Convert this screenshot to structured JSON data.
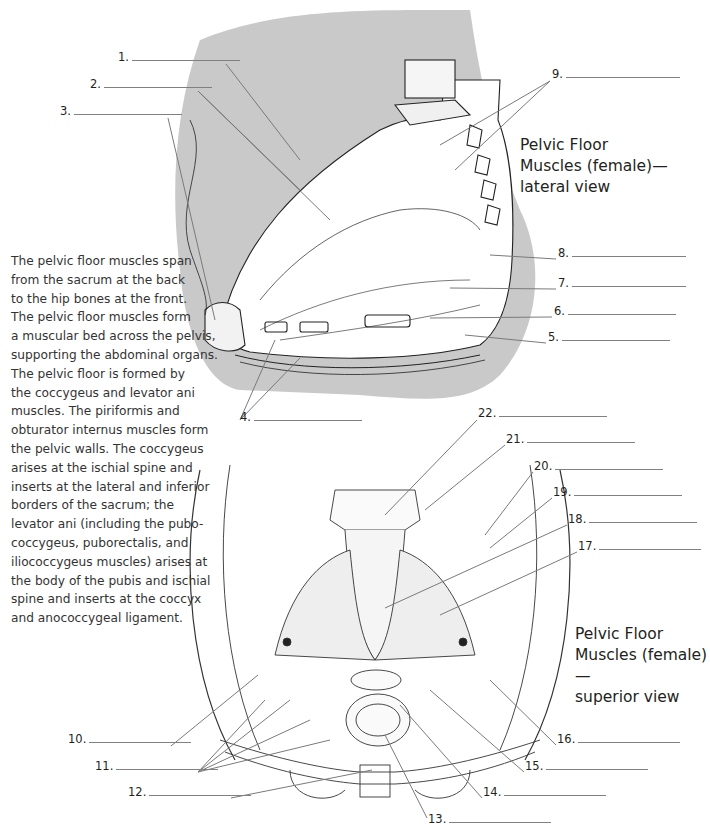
{
  "description": [
    "The pelvic floor muscles span",
    "from the sacrum at the back",
    "to the hip bones at the front.",
    "The pelvic floor muscles form",
    "a muscular bed across the pelvis,",
    "supporting the abdominal organs.",
    "The pelvic floor is formed by",
    "the coccygeus and levator ani",
    "muscles. The piriformis and",
    "obturator internus muscles form",
    "the pelvic walls. The coccygeus",
    "arises at the ischial spine and",
    "inserts at the lateral and inferior",
    "borders of the sacrum; the",
    "levator ani (including the pubo-",
    "coccygeus, puborectalis, and",
    "iliococcygeus muscles) arises at",
    "the body of the pubis and ischial",
    "spine and inserts at the coccyx",
    "and anococcygeal ligament."
  ],
  "lateral_view": {
    "title_lines": [
      "Pelvic Floor",
      "Muscles (female)—",
      "lateral view"
    ],
    "labels": [
      {
        "num": "1.",
        "x": 118,
        "y": 58,
        "w": 108
      },
      {
        "num": "2.",
        "x": 90,
        "y": 85,
        "w": 108
      },
      {
        "num": "3.",
        "x": 60,
        "y": 112,
        "w": 108
      },
      {
        "num": "4.",
        "x": 240,
        "y": 418,
        "w": 108
      },
      {
        "num": "5.",
        "x": 548,
        "y": 338,
        "w": 108
      },
      {
        "num": "6.",
        "x": 554,
        "y": 312,
        "w": 108
      },
      {
        "num": "7.",
        "x": 558,
        "y": 284,
        "w": 114
      },
      {
        "num": "8.",
        "x": 558,
        "y": 254,
        "w": 114
      },
      {
        "num": "9.",
        "x": 552,
        "y": 75,
        "w": 114
      }
    ]
  },
  "superior_view": {
    "title_lines": [
      "Pelvic Floor",
      "Muscles (female)—",
      "superior view"
    ],
    "labels": [
      {
        "num": "10.",
        "x": 68,
        "y": 740,
        "w": 102
      },
      {
        "num": "11.",
        "x": 95,
        "y": 767,
        "w": 102
      },
      {
        "num": "12.",
        "x": 128,
        "y": 793,
        "w": 102
      },
      {
        "num": "13.",
        "x": 428,
        "y": 820,
        "w": 102
      },
      {
        "num": "14.",
        "x": 483,
        "y": 793,
        "w": 102
      },
      {
        "num": "15.",
        "x": 525,
        "y": 767,
        "w": 102
      },
      {
        "num": "16.",
        "x": 557,
        "y": 740,
        "w": 102
      },
      {
        "num": "17.",
        "x": 578,
        "y": 547,
        "w": 102
      },
      {
        "num": "18.",
        "x": 568,
        "y": 520,
        "w": 108
      },
      {
        "num": "19.",
        "x": 553,
        "y": 493,
        "w": 108
      },
      {
        "num": "20.",
        "x": 534,
        "y": 467,
        "w": 108
      },
      {
        "num": "21.",
        "x": 506,
        "y": 440,
        "w": 108
      },
      {
        "num": "22.",
        "x": 478,
        "y": 414,
        "w": 108
      }
    ]
  }
}
